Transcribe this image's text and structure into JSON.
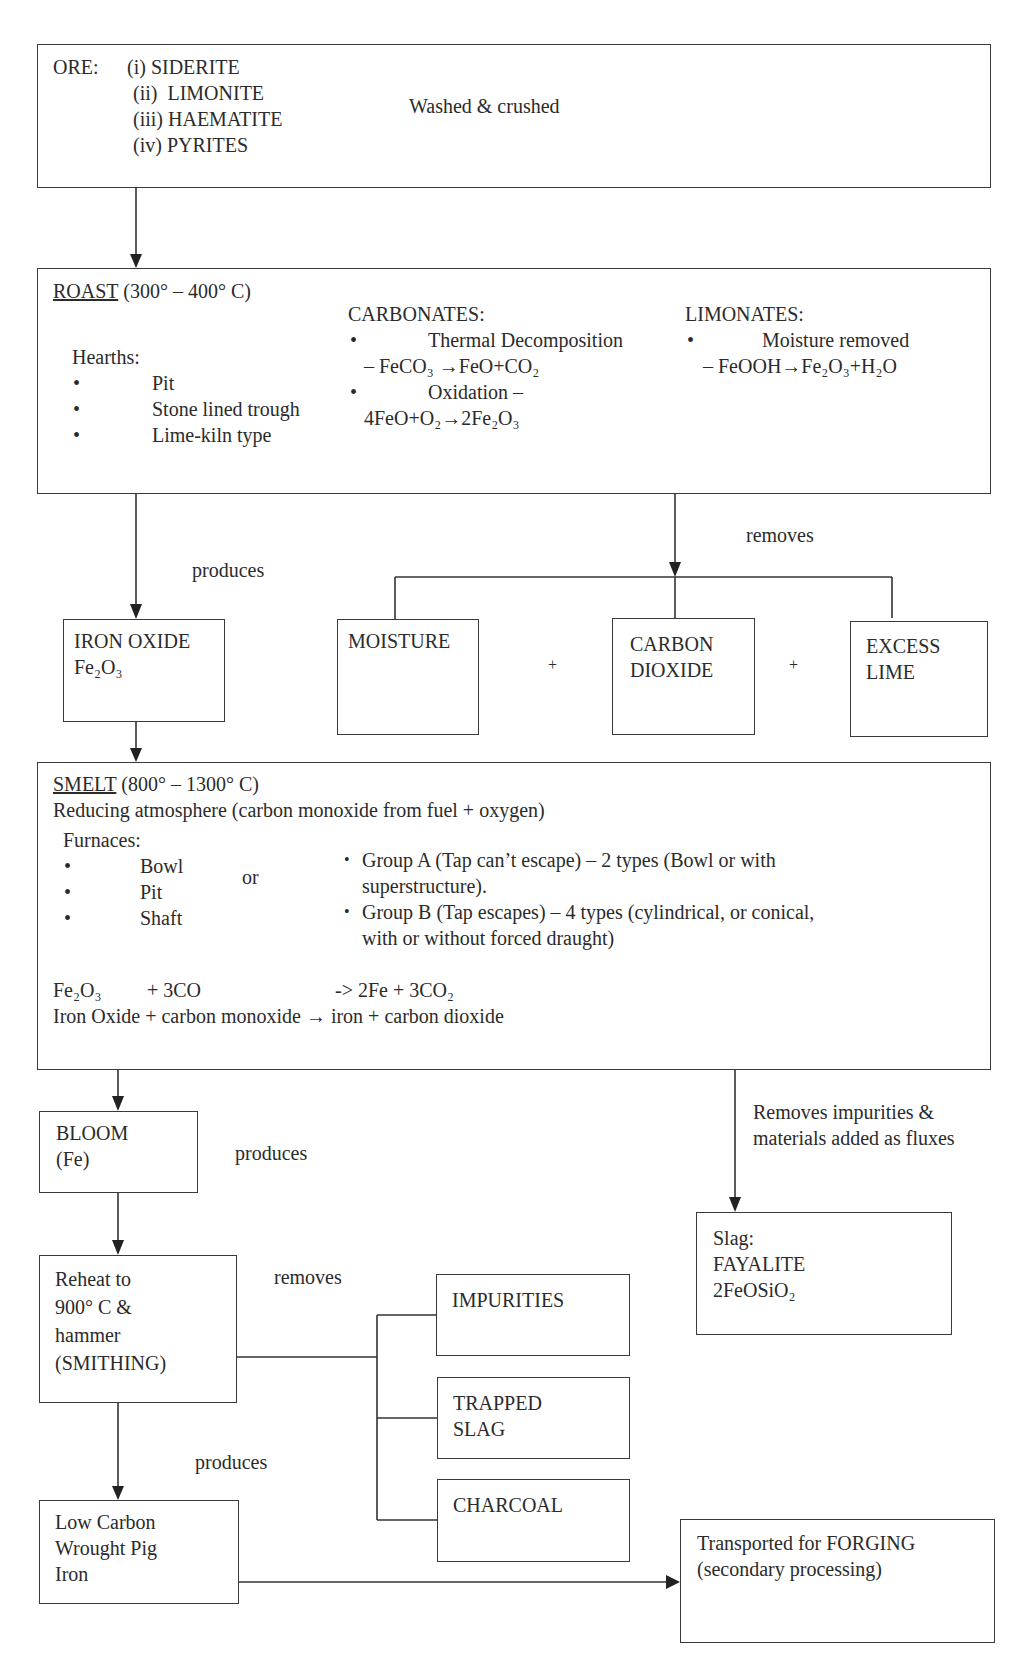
{
  "ore": {
    "label": "ORE:",
    "items": [
      "(i) SIDERITE",
      "(ii)  LIMONITE",
      "(iii) HAEMATITE",
      "(iv) PYRITES"
    ],
    "note": "Washed & crushed"
  },
  "roast": {
    "title": "ROAST",
    "temp": " (300° – 400° C)",
    "hearths_label": "Hearths:",
    "hearths": [
      "Pit",
      "Stone lined trough",
      "Lime-kiln type"
    ],
    "carbonates_label": "CARBONATES:",
    "carbonates": [
      {
        "title": "Thermal Decomposition",
        "eq": "– FeCO₃ →FeO+CO₂"
      },
      {
        "title": "Oxidation –",
        "eq": "4FeO+O₂→2Fe₂O₃"
      }
    ],
    "limonates_label": "LIMONATES:",
    "limonates": [
      {
        "title": "Moisture removed",
        "eq": "– FeOOH→Fe₂O₃+H₂O"
      }
    ]
  },
  "connectors": {
    "produces_1": "produces",
    "removes_1": "removes",
    "plus": "+",
    "produces_2": "produces",
    "slag_note_1": "Removes impurities &",
    "slag_note_2": "materials added as fluxes",
    "removes_2": "removes",
    "produces_3": "produces"
  },
  "iron_oxide": {
    "line1": "IRON OXIDE",
    "line2": "Fe₂O₃"
  },
  "byproducts_roast": [
    {
      "lines": [
        "MOISTURE"
      ]
    },
    {
      "lines": [
        "CARBON",
        "DIOXIDE"
      ]
    },
    {
      "lines": [
        "EXCESS",
        "LIME"
      ]
    }
  ],
  "smelt": {
    "title": "SMELT",
    "temp": " (800° – 1300° C)",
    "atmosphere": "Reducing atmosphere (carbon monoxide from fuel + oxygen)",
    "furnaces_label": "Furnaces:",
    "furnaces": [
      "Bowl",
      "Pit",
      "Shaft"
    ],
    "or": "or",
    "groups": [
      {
        "line1": "Group A (Tap can’t escape) – 2 types (Bowl or with",
        "line2": "superstructure)."
      },
      {
        "line1": "Group B (Tap escapes) – 4 types (cylindrical, or conical,",
        "line2": "with or without forced draught)"
      }
    ],
    "eq_reactant1": "Fe₂O₃",
    "eq_reactant2": "+ 3CO",
    "eq_product": "-> 2Fe + 3CO₂",
    "eq_words": "Iron Oxide + carbon monoxide → iron + carbon dioxide"
  },
  "bloom": {
    "line1": "BLOOM",
    "line2": "(Fe)"
  },
  "slag": {
    "line1": "Slag:",
    "line2": "FAYALITE",
    "line3": "2FeOSiO₂"
  },
  "reheat": {
    "lines": [
      "Reheat to",
      "900° C &",
      "hammer",
      "(SMITHING)"
    ]
  },
  "byproducts_smith": [
    {
      "lines": [
        "IMPURITIES"
      ]
    },
    {
      "lines": [
        "TRAPPED",
        "SLAG"
      ]
    },
    {
      "lines": [
        "CHARCOAL"
      ]
    }
  ],
  "wrought": {
    "lines": [
      "Low Carbon",
      "Wrought Pig",
      "Iron"
    ]
  },
  "forging": {
    "line1": "Transported for FORGING",
    "line2": "(secondary processing)"
  }
}
